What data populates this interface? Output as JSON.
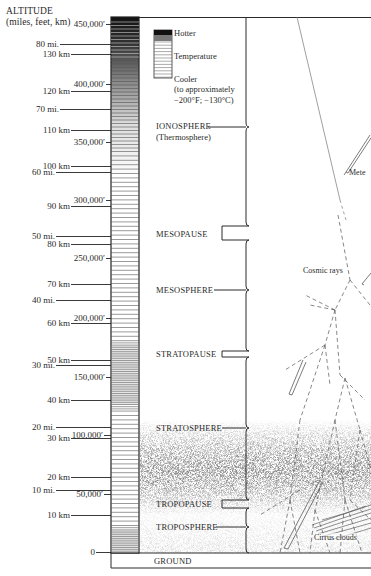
{
  "axis": {
    "title_line1": "ALTITUDE",
    "title_line2": "(miles, feet, km)"
  },
  "ticks": [
    {
      "label": "450,000′",
      "y": 24,
      "x_label_right": 106,
      "line_from": 106,
      "line_to": 111
    },
    {
      "label": "80 mi.",
      "y": 44,
      "x_label_right": 60,
      "line_from": 60,
      "line_to": 111
    },
    {
      "label": "130 km",
      "y": 54,
      "x_label_right": 71,
      "line_from": 71,
      "line_to": 111
    },
    {
      "label": "400,000′",
      "y": 84,
      "x_label_right": 106,
      "line_from": 106,
      "line_to": 111
    },
    {
      "label": "120 km",
      "y": 91,
      "x_label_right": 71,
      "line_from": 71,
      "line_to": 111
    },
    {
      "label": "70 mi.",
      "y": 109,
      "x_label_right": 60,
      "line_from": 60,
      "line_to": 111
    },
    {
      "label": "110 km",
      "y": 130,
      "x_label_right": 71,
      "line_from": 71,
      "line_to": 111
    },
    {
      "label": "350,000′",
      "y": 142,
      "x_label_right": 106,
      "line_from": 106,
      "line_to": 111
    },
    {
      "label": "100 km",
      "y": 166,
      "x_label_right": 71,
      "line_from": 71,
      "line_to": 111
    },
    {
      "label": "60 mi.",
      "y": 172,
      "x_label_right": 56,
      "line_from": 56,
      "line_to": 111
    },
    {
      "label": "300,000′",
      "y": 200,
      "x_label_right": 106,
      "line_from": 106,
      "line_to": 111
    },
    {
      "label": "90 km",
      "y": 206,
      "x_label_right": 71,
      "line_from": 71,
      "line_to": 111
    },
    {
      "label": "50 mi.",
      "y": 236,
      "x_label_right": 56,
      "line_from": 56,
      "line_to": 111
    },
    {
      "label": "80 km",
      "y": 244,
      "x_label_right": 71,
      "line_from": 71,
      "line_to": 111
    },
    {
      "label": "250,000′",
      "y": 258,
      "x_label_right": 106,
      "line_from": 106,
      "line_to": 111
    },
    {
      "label": "70 km",
      "y": 284,
      "x_label_right": 71,
      "line_from": 71,
      "line_to": 111
    },
    {
      "label": "40 mi.",
      "y": 300,
      "x_label_right": 56,
      "line_from": 56,
      "line_to": 111
    },
    {
      "label": "200,000′",
      "y": 318,
      "x_label_right": 106,
      "line_from": 106,
      "line_to": 111
    },
    {
      "label": "60 km",
      "y": 323,
      "x_label_right": 71,
      "line_from": 71,
      "line_to": 111
    },
    {
      "label": "50 km",
      "y": 360,
      "x_label_right": 71,
      "line_from": 71,
      "line_to": 111
    },
    {
      "label": "30 mi.",
      "y": 365,
      "x_label_right": 56,
      "line_from": 56,
      "line_to": 111
    },
    {
      "label": "150,000′",
      "y": 377,
      "x_label_right": 106,
      "line_from": 106,
      "line_to": 111
    },
    {
      "label": "40 km",
      "y": 400,
      "x_label_right": 71,
      "line_from": 71,
      "line_to": 111
    },
    {
      "label": "20 mi.",
      "y": 427,
      "x_label_right": 56,
      "line_from": 56,
      "line_to": 111
    },
    {
      "label": "100,000′",
      "y": 435,
      "x_label_right": 104,
      "line_from": 104,
      "line_to": 111
    },
    {
      "label": "30 km",
      "y": 438,
      "x_label_right": 71,
      "line_from": 71,
      "line_to": 111
    },
    {
      "label": "20 km",
      "y": 477,
      "x_label_right": 71,
      "line_from": 71,
      "line_to": 111
    },
    {
      "label": "10 mi.",
      "y": 490,
      "x_label_right": 56,
      "line_from": 56,
      "line_to": 111
    },
    {
      "label": "50,000′",
      "y": 494,
      "x_label_right": 104,
      "line_from": 104,
      "line_to": 111
    },
    {
      "label": "10 km",
      "y": 515,
      "x_label_right": 71,
      "line_from": 71,
      "line_to": 111
    },
    {
      "label": "0",
      "y": 552,
      "x_label_right": 96,
      "line_from": 96,
      "line_to": 111
    }
  ],
  "legend": {
    "hotter": "Hotter",
    "temperature": "Temperature",
    "cooler": "Cooler",
    "note_line1": "(to approximately",
    "note_line2": "−200°F; −130°C)"
  },
  "regions": [
    {
      "id": "ionosphere",
      "label": "IONOSPHERE",
      "label2": "(Thermosphere)",
      "y": 127
    },
    {
      "id": "mesopause",
      "label": "MESOPAUSE",
      "y": 234
    },
    {
      "id": "mesosphere",
      "label": "MESOSPHERE",
      "y": 290
    },
    {
      "id": "stratopause",
      "label": "STRATOPAUSE",
      "y": 354
    },
    {
      "id": "stratosphere",
      "label": "STRATOSPHERE",
      "y": 428
    },
    {
      "id": "tropopause",
      "label": "TROPOPAUSE",
      "y": 504
    },
    {
      "id": "troposphere",
      "label": "TROPOSPHERE",
      "y": 527
    }
  ],
  "ground": {
    "label": "GROUND"
  },
  "annotations": {
    "meteors": "Mete",
    "cosmic_rays": "Cosmic rays",
    "cirrus_clouds": "Cirrus clouds"
  },
  "colors": {
    "ink": "#2a2a2a",
    "background": "#ffffff",
    "dust": "#555555"
  }
}
